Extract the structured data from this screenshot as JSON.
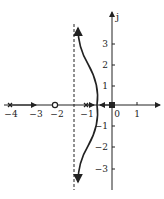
{
  "diagram": {
    "type": "root-locus",
    "axes": {
      "real_axis": {
        "min": -4.2,
        "max": 1.8
      },
      "imag_axis": {
        "label": "j",
        "min": -3.6,
        "max": 4.3
      },
      "real_ticks": [
        {
          "value": -4,
          "label": "−4"
        },
        {
          "value": -3,
          "label": "−3"
        },
        {
          "value": -2,
          "label": "−2"
        },
        {
          "value": -1,
          "label": "−1"
        },
        {
          "value": 0,
          "label": "0"
        },
        {
          "value": 1,
          "label": "1"
        }
      ],
      "imag_ticks": [
        {
          "value": 3,
          "label": "3"
        },
        {
          "value": 2,
          "label": "2"
        },
        {
          "value": 1,
          "label": "1"
        },
        {
          "value": -1,
          "label": "−1"
        },
        {
          "value": -2,
          "label": "−2"
        },
        {
          "value": -3,
          "label": "−3"
        }
      ]
    },
    "poles": [
      -4,
      -1,
      0
    ],
    "zeros": [
      -2
    ],
    "asymptote": {
      "real": -1.5,
      "style": "dashed"
    },
    "colors": {
      "ink": "#222222",
      "background": "#ffffff"
    }
  }
}
